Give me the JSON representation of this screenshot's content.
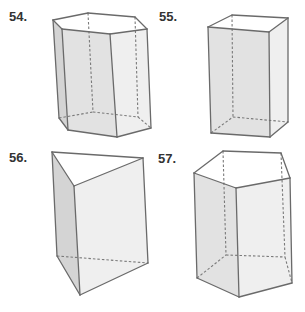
{
  "colors": {
    "background": "#ffffff",
    "edge": "#6a6a6a",
    "hidden_edge": "#7a7a7a",
    "label": "#333333",
    "face_dark": "#d4d4d4",
    "face_mid": "#e2e2e2",
    "face_light": "#efefef",
    "face_top": "#ffffff"
  },
  "figures": [
    {
      "id": "54",
      "label": "54.",
      "label_pos": [
        9,
        21
      ],
      "shape": "hexagonal prism",
      "faces": [
        {
          "fill": "face_light",
          "points": [
            [
              62,
              29
            ],
            [
              110,
              34
            ],
            [
              147,
              29
            ],
            [
              151,
              128
            ],
            [
              117,
              137
            ],
            [
              68,
              130
            ],
            [
              59,
              118
            ],
            [
              53,
              20
            ]
          ]
        },
        {
          "fill": "face_dark",
          "points": [
            [
              53,
              20
            ],
            [
              62,
              29
            ],
            [
              68,
              130
            ],
            [
              59,
              118
            ]
          ]
        },
        {
          "fill": "face_mid",
          "points": [
            [
              62,
              29
            ],
            [
              110,
              34
            ],
            [
              117,
              137
            ],
            [
              68,
              130
            ]
          ]
        },
        {
          "fill": "face_top",
          "points": [
            [
              53,
              20
            ],
            [
              88,
              13
            ],
            [
              135,
              17
            ],
            [
              147,
              29
            ],
            [
              110,
              34
            ],
            [
              62,
              29
            ]
          ]
        }
      ],
      "edges": [
        [
          [
            53,
            20
          ],
          [
            88,
            13
          ]
        ],
        [
          [
            88,
            13
          ],
          [
            135,
            17
          ]
        ],
        [
          [
            135,
            17
          ],
          [
            147,
            29
          ]
        ],
        [
          [
            147,
            29
          ],
          [
            110,
            34
          ]
        ],
        [
          [
            110,
            34
          ],
          [
            62,
            29
          ]
        ],
        [
          [
            62,
            29
          ],
          [
            53,
            20
          ]
        ],
        [
          [
            53,
            20
          ],
          [
            59,
            118
          ]
        ],
        [
          [
            62,
            29
          ],
          [
            68,
            130
          ]
        ],
        [
          [
            110,
            34
          ],
          [
            117,
            137
          ]
        ],
        [
          [
            147,
            29
          ],
          [
            151,
            128
          ]
        ],
        [
          [
            59,
            118
          ],
          [
            68,
            130
          ]
        ],
        [
          [
            68,
            130
          ],
          [
            117,
            137
          ]
        ],
        [
          [
            117,
            137
          ],
          [
            151,
            128
          ]
        ]
      ],
      "hidden_edges": [
        [
          [
            88,
            13
          ],
          [
            93,
            112
          ]
        ],
        [
          [
            135,
            17
          ],
          [
            138,
            117
          ]
        ],
        [
          [
            59,
            118
          ],
          [
            93,
            112
          ]
        ],
        [
          [
            93,
            112
          ],
          [
            138,
            117
          ]
        ],
        [
          [
            138,
            117
          ],
          [
            151,
            128
          ]
        ]
      ]
    },
    {
      "id": "55",
      "label": "55.",
      "label_pos": [
        159,
        21
      ],
      "shape": "rectangular prism",
      "faces": [
        {
          "fill": "face_light",
          "points": [
            [
              269,
              32
            ],
            [
              288,
              18
            ],
            [
              288,
              122
            ],
            [
              270,
              137
            ]
          ]
        },
        {
          "fill": "face_mid",
          "points": [
            [
              208,
              27
            ],
            [
              269,
              32
            ],
            [
              270,
              137
            ],
            [
              211,
              133
            ]
          ]
        },
        {
          "fill": "face_top",
          "points": [
            [
              208,
              27
            ],
            [
              232,
              15
            ],
            [
              288,
              18
            ],
            [
              269,
              32
            ]
          ]
        }
      ],
      "edges": [
        [
          [
            208,
            27
          ],
          [
            232,
            15
          ]
        ],
        [
          [
            232,
            15
          ],
          [
            288,
            18
          ]
        ],
        [
          [
            288,
            18
          ],
          [
            269,
            32
          ]
        ],
        [
          [
            269,
            32
          ],
          [
            208,
            27
          ]
        ],
        [
          [
            208,
            27
          ],
          [
            211,
            133
          ]
        ],
        [
          [
            269,
            32
          ],
          [
            270,
            137
          ]
        ],
        [
          [
            288,
            18
          ],
          [
            288,
            122
          ]
        ],
        [
          [
            211,
            133
          ],
          [
            270,
            137
          ]
        ],
        [
          [
            270,
            137
          ],
          [
            288,
            122
          ]
        ]
      ],
      "hidden_edges": [
        [
          [
            232,
            15
          ],
          [
            233,
            117
          ]
        ],
        [
          [
            211,
            133
          ],
          [
            233,
            117
          ]
        ],
        [
          [
            233,
            117
          ],
          [
            288,
            122
          ]
        ]
      ]
    },
    {
      "id": "56",
      "label": "56.",
      "label_pos": [
        9,
        162
      ],
      "shape": "triangular prism",
      "faces": [
        {
          "fill": "face_dark",
          "points": [
            [
              52,
              152
            ],
            [
              74,
              186
            ],
            [
              80,
              295
            ],
            [
              57,
              256
            ]
          ]
        },
        {
          "fill": "face_light",
          "points": [
            [
              74,
              186
            ],
            [
              143,
              158
            ],
            [
              148,
              263
            ],
            [
              80,
              295
            ]
          ]
        },
        {
          "fill": "face_top",
          "points": [
            [
              52,
              152
            ],
            [
              143,
              158
            ],
            [
              74,
              186
            ]
          ]
        }
      ],
      "edges": [
        [
          [
            52,
            152
          ],
          [
            143,
            158
          ]
        ],
        [
          [
            143,
            158
          ],
          [
            74,
            186
          ]
        ],
        [
          [
            74,
            186
          ],
          [
            52,
            152
          ]
        ],
        [
          [
            52,
            152
          ],
          [
            57,
            256
          ]
        ],
        [
          [
            74,
            186
          ],
          [
            80,
            295
          ]
        ],
        [
          [
            143,
            158
          ],
          [
            148,
            263
          ]
        ],
        [
          [
            57,
            256
          ],
          [
            80,
            295
          ]
        ],
        [
          [
            80,
            295
          ],
          [
            148,
            263
          ]
        ]
      ],
      "hidden_edges": [
        [
          [
            57,
            256
          ],
          [
            148,
            263
          ]
        ]
      ]
    },
    {
      "id": "57",
      "label": "57.",
      "label_pos": [
        158,
        163
      ],
      "shape": "pentagonal prism",
      "faces": [
        {
          "fill": "face_mid",
          "points": [
            [
              194,
              173
            ],
            [
              236,
              188
            ],
            [
              239,
              297
            ],
            [
              197,
              278
            ]
          ]
        },
        {
          "fill": "face_light",
          "points": [
            [
              236,
              188
            ],
            [
              290,
              178
            ],
            [
              292,
              283
            ],
            [
              239,
              297
            ]
          ]
        },
        {
          "fill": "face_top",
          "points": [
            [
              194,
              173
            ],
            [
              223,
              151
            ],
            [
              281,
              153
            ],
            [
              290,
              178
            ],
            [
              236,
              188
            ]
          ]
        }
      ],
      "edges": [
        [
          [
            194,
            173
          ],
          [
            223,
            151
          ]
        ],
        [
          [
            223,
            151
          ],
          [
            281,
            153
          ]
        ],
        [
          [
            281,
            153
          ],
          [
            290,
            178
          ]
        ],
        [
          [
            290,
            178
          ],
          [
            236,
            188
          ]
        ],
        [
          [
            236,
            188
          ],
          [
            194,
            173
          ]
        ],
        [
          [
            194,
            173
          ],
          [
            197,
            278
          ]
        ],
        [
          [
            236,
            188
          ],
          [
            239,
            297
          ]
        ],
        [
          [
            290,
            178
          ],
          [
            292,
            283
          ]
        ],
        [
          [
            197,
            278
          ],
          [
            239,
            297
          ]
        ],
        [
          [
            239,
            297
          ],
          [
            292,
            283
          ]
        ]
      ],
      "hidden_edges": [
        [
          [
            223,
            151
          ],
          [
            226,
            255
          ]
        ],
        [
          [
            281,
            153
          ],
          [
            285,
            257
          ]
        ],
        [
          [
            197,
            278
          ],
          [
            226,
            255
          ]
        ],
        [
          [
            226,
            255
          ],
          [
            285,
            257
          ]
        ],
        [
          [
            285,
            257
          ],
          [
            292,
            283
          ]
        ]
      ]
    }
  ]
}
